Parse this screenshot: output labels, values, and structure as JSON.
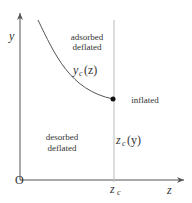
{
  "diagram": {
    "axes": {
      "y_label": "y",
      "x_label": "z",
      "origin_label": "O"
    },
    "regions": {
      "top_left": [
        "adsorbed",
        "deflated"
      ],
      "bottom_left": [
        "desorbed",
        "deflated"
      ],
      "right": "inflated"
    },
    "curve_label": {
      "main": "y",
      "sub": "c",
      "arg": "(z)"
    },
    "line_label": {
      "main": "z",
      "sub": "c",
      "arg": "(y)"
    },
    "tick_label": {
      "main": "z",
      "sub": "c"
    },
    "colors": {
      "line": "#555555",
      "dot": "#111111",
      "vline": "#bbbbbb"
    }
  }
}
